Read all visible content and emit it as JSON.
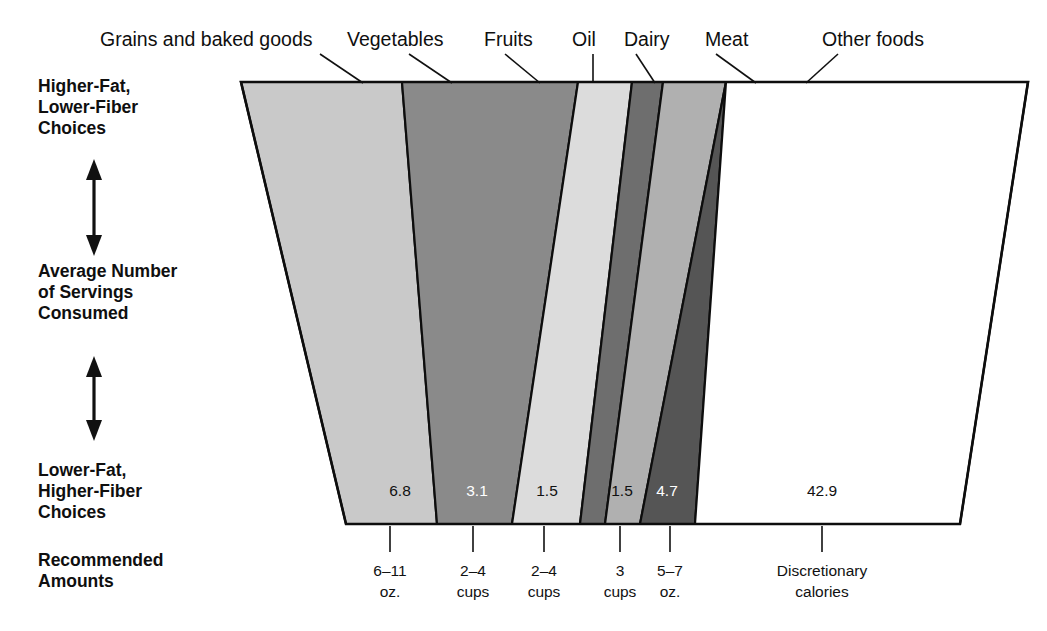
{
  "chart_data": {
    "type": "bar",
    "orientation": "vertical-trapezoid-band",
    "categories": [
      "Grains and baked goods",
      "Vegetables",
      "Fruits",
      "Oil",
      "Dairy",
      "Meat",
      "Other foods"
    ],
    "values": [
      6.8,
      3.1,
      1.5,
      null,
      1.5,
      4.7,
      42.9
    ],
    "value_labels": [
      "6.8",
      "3.1",
      "1.5",
      "",
      "1.5",
      "4.7",
      "42.9"
    ],
    "recommended": [
      "6–11 oz.",
      "2–4 cups",
      "2–4 cups",
      "",
      "3 cups",
      "5–7 oz.",
      "Discretionary calories"
    ],
    "series": [
      {
        "name": "Average Number of Servings Consumed",
        "values": [
          6.8,
          3.1,
          1.5,
          null,
          1.5,
          4.7,
          42.9
        ]
      }
    ],
    "xlabel": "",
    "ylabel": "Average Number of Servings Consumed",
    "grid": false,
    "legend": "none"
  },
  "axis": {
    "top_label": "Higher-Fat,\nLower-Fiber\nChoices",
    "top_label_lines": [
      "Higher-Fat,",
      "Lower-Fiber",
      "Choices"
    ],
    "middle_label_lines": [
      "Average Number",
      "of Servings",
      "Consumed"
    ],
    "bottom_label_lines": [
      "Lower-Fat,",
      "Higher-Fiber",
      "Choices"
    ],
    "recommended_label_lines": [
      "Recommended",
      "Amounts"
    ]
  },
  "bands": [
    {
      "name": "grains-and-baked-goods",
      "label": "Grains and baked goods",
      "value": "6.8",
      "recommended_lines": [
        "6–11",
        "oz."
      ],
      "color": "#c9c9c9",
      "value_on_dark": false,
      "label_x": 100,
      "label_y": 46,
      "leader": "M 320 54 L 363 83",
      "top_left": 241,
      "top_right": 402,
      "bottom_left": 346,
      "bottom_right": 437,
      "value_x": 400,
      "tick_x": 390,
      "rec_x": 390
    },
    {
      "name": "vegetables",
      "label": "Vegetables",
      "value": "3.1",
      "recommended_lines": [
        "2–4",
        "cups"
      ],
      "color": "#8a8a8a",
      "value_on_dark": true,
      "label_x": 347,
      "label_y": 46,
      "leader": "M 409 54 L 452 83",
      "top_left": 402,
      "top_right": 578,
      "bottom_left": 437,
      "bottom_right": 512,
      "value_x": 477,
      "tick_x": 473,
      "rec_x": 473
    },
    {
      "name": "fruits",
      "label": "Fruits",
      "value": "1.5",
      "recommended_lines": [
        "2–4",
        "cups"
      ],
      "color": "#dcdcdc",
      "value_on_dark": false,
      "label_x": 484,
      "label_y": 46,
      "leader": "M 505 54 L 540 83",
      "top_left": 578,
      "top_right": 632,
      "bottom_left": 512,
      "bottom_right": 580,
      "value_x": 547,
      "tick_x": 544,
      "rec_x": 544
    },
    {
      "name": "oil",
      "label": "Oil",
      "value": "",
      "recommended_lines": [
        "",
        ""
      ],
      "color": "#6e6e6e",
      "value_on_dark": true,
      "label_x": 572,
      "label_y": 46,
      "leader": "M 593 54 L 593 83",
      "top_left": 632,
      "top_right": 663,
      "bottom_left": 580,
      "bottom_right": 605,
      "value_x": 592,
      "tick_x": 0,
      "rec_x": 0
    },
    {
      "name": "dairy",
      "label": "Dairy",
      "value": "1.5",
      "recommended_lines": [
        "3",
        "cups"
      ],
      "color": "#b0b0b0",
      "value_on_dark": false,
      "label_x": 624,
      "label_y": 46,
      "leader": "M 636 54 L 655 83",
      "top_left": 663,
      "top_right": 726,
      "bottom_left": 605,
      "bottom_right": 640,
      "value_x": 622,
      "tick_x": 620,
      "rec_x": 620
    },
    {
      "name": "meat",
      "label": "Meat",
      "value": "4.7",
      "recommended_lines": [
        "5–7",
        "oz."
      ],
      "color": "#555555",
      "value_on_dark": true,
      "label_x": 705,
      "label_y": 46,
      "leader": "M 716 54 L 756 83",
      "top_left": 726,
      "top_right": 726,
      "bottom_left": 640,
      "bottom_right": 695,
      "value_x": 667,
      "tick_x": 670,
      "rec_x": 670
    },
    {
      "name": "other-foods",
      "label": "Other foods",
      "value": "42.9",
      "recommended_lines": [
        "Discretionary",
        "calories"
      ],
      "color": "#ffffff",
      "value_on_dark": false,
      "label_x": 822,
      "label_y": 46,
      "leader": "M 838 54 L 806 83",
      "top_left": 726,
      "top_right": 1028,
      "bottom_left": 695,
      "bottom_right": 960,
      "value_x": 822,
      "tick_x": 822,
      "rec_x": 822
    }
  ],
  "colors": {
    "outline": "#0d0d0d",
    "text": "#111111",
    "background": "#ffffff"
  }
}
